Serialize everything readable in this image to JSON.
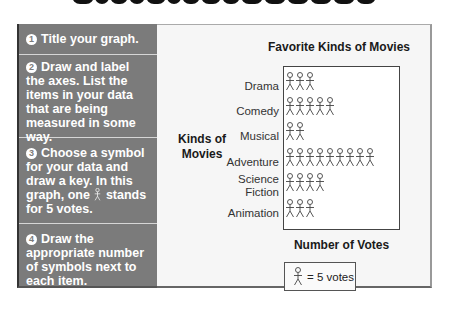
{
  "header": {
    "cutoff_title_visible": true
  },
  "steps": [
    {
      "number": "1",
      "text": "Title your graph."
    },
    {
      "number": "2",
      "text": "Draw and label the axes. List the items in your data that are being measured in some way."
    },
    {
      "number": "3",
      "text_before": "Choose a symbol for your data and draw a key. In this graph, one",
      "text_after": "stands for 5 votes."
    },
    {
      "number": "4",
      "text": "Draw the appropriate number of symbols next to each item."
    }
  ],
  "chart": {
    "title": "Favorite Kinds of Movies",
    "y_axis_label": "Kinds of Movies",
    "x_axis_label": "Number of Votes",
    "key_text": "= 5 votes",
    "symbol": "stick-figure-icon"
  },
  "chart_data": {
    "type": "pictograph",
    "title": "Favorite Kinds of Movies",
    "xlabel": "Number of Votes",
    "ylabel": "Kinds of Movies",
    "categories": [
      "Drama",
      "Comedy",
      "Musical",
      "Adventure",
      "Science Fiction",
      "Animation"
    ],
    "symbol_counts": [
      3,
      5,
      2,
      9,
      4,
      3
    ],
    "values": [
      15,
      25,
      10,
      45,
      20,
      15
    ],
    "key": {
      "symbol": "stick figure",
      "value": 5,
      "label": "= 5 votes"
    }
  }
}
